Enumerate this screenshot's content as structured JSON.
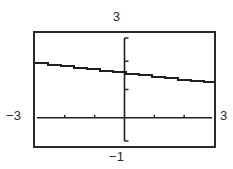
{
  "screen": {
    "kind": "graphing-calculator-screen",
    "frame_color": "#2a2a2a",
    "background_color": "#ffffff",
    "curve_color": "#1f1f1f"
  },
  "labels": {
    "ymax": "3",
    "ymin": "−1",
    "xmin": "−3",
    "xmax": "3"
  },
  "chart_data": {
    "type": "line",
    "title": "",
    "xlabel": "",
    "ylabel": "",
    "xlim": [
      -3,
      3
    ],
    "ylim": [
      -1,
      3
    ],
    "grid": false,
    "legend": null,
    "axes": {
      "x_axis_y_value": 0,
      "y_axis_x_value": 0,
      "x_tick_spacing": 1,
      "y_tick_spacing": 1,
      "x_ticks": [
        -3,
        -2,
        -1,
        0,
        1,
        2,
        3
      ],
      "y_ticks": [
        -1,
        0,
        1,
        2,
        3
      ],
      "x_axis_visible": true,
      "y_axis_visible": true
    },
    "series": [
      {
        "name": "curve",
        "style": "pixelated-step-line",
        "x": [
          -3.0,
          -2.5,
          -2.0,
          -1.5,
          -1.0,
          -0.5,
          0.0,
          0.5,
          1.0,
          1.5,
          2.0,
          2.5,
          3.0
        ],
        "y": [
          1.95,
          1.89,
          1.83,
          1.77,
          1.71,
          1.65,
          1.59,
          1.53,
          1.47,
          1.41,
          1.35,
          1.29,
          1.23
        ]
      }
    ],
    "annotations": []
  }
}
